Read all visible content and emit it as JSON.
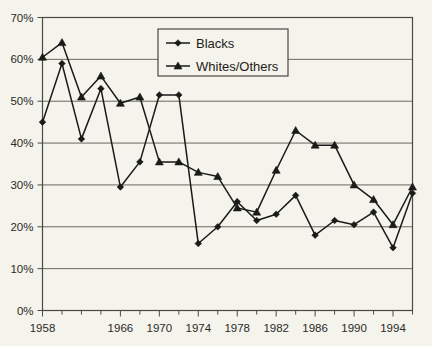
{
  "chart_data": {
    "type": "line",
    "title": "",
    "xlabel": "",
    "ylabel": "",
    "x": [
      1958,
      1960,
      1962,
      1964,
      1966,
      1968,
      1970,
      1972,
      1974,
      1976,
      1978,
      1980,
      1982,
      1984,
      1986,
      1988,
      1990,
      1992,
      1994,
      1996
    ],
    "xlim": [
      1958,
      1996
    ],
    "ylim": [
      0,
      70
    ],
    "ytick_labels": [
      "0%",
      "10%",
      "20%",
      "30%",
      "40%",
      "50%",
      "60%",
      "70%"
    ],
    "ytick_values": [
      0,
      10,
      20,
      30,
      40,
      50,
      60,
      70
    ],
    "xtick_labels": [
      "1958",
      "1966",
      "1970",
      "1974",
      "1978",
      "1982",
      "1986",
      "1990",
      "1994"
    ],
    "xtick_label_values": [
      1958,
      1966,
      1970,
      1974,
      1978,
      1982,
      1986,
      1990,
      1994
    ],
    "xtick_minor_values": [
      1960,
      1962,
      1964,
      1968,
      1972,
      1976,
      1980,
      1984,
      1988,
      1992,
      1996
    ],
    "grid": "horizontal",
    "legend_position": "top-center",
    "series": [
      {
        "name": "Blacks",
        "marker": "diamond",
        "color": "#1a1a18",
        "values": [
          45,
          59,
          41,
          53,
          29.5,
          35.5,
          51.5,
          51.5,
          16,
          20,
          26,
          21.5,
          23,
          27.5,
          18,
          21.5,
          20.5,
          23.5,
          15,
          28
        ]
      },
      {
        "name": "Whites/Others",
        "marker": "triangle",
        "color": "#1a1a18",
        "values": [
          60.5,
          64,
          51,
          56,
          49.5,
          51,
          35.5,
          35.5,
          33,
          32,
          24.5,
          23.5,
          33.5,
          43,
          39.5,
          39.5,
          30,
          26.5,
          20.5,
          29.5
        ]
      }
    ]
  },
  "legend": {
    "entries": [
      {
        "label": "Blacks"
      },
      {
        "label": "Whites/Others"
      }
    ]
  },
  "colors": {
    "background": "#f4f3ec",
    "plot_background": "#f4f3ec",
    "gridline": "#6a695f",
    "axis": "#4a4943",
    "line": "#1a1a18",
    "text": "#2b2a26"
  }
}
